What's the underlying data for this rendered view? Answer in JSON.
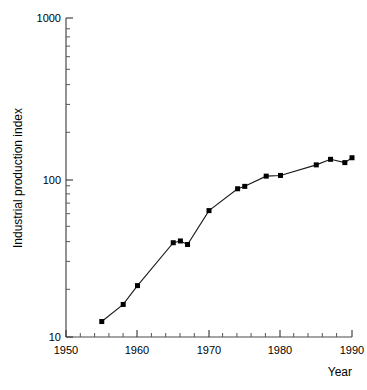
{
  "chart_data": {
    "type": "line",
    "title": "",
    "xlabel": "Year",
    "ylabel": "Industrial production index",
    "xlim": [
      1950,
      1990
    ],
    "ylim": [
      10,
      1000
    ],
    "yscale": "log",
    "xscale": "linear",
    "grid": false,
    "legend": null,
    "marker": "square",
    "series_color": "#000000",
    "xticks": [
      1950,
      1960,
      1970,
      1980,
      1990
    ],
    "xticklabels": [
      "1950",
      "1960",
      "1970",
      "1980",
      "1990"
    ],
    "xminorticks": [
      1952,
      1954,
      1956,
      1958,
      1962,
      1964,
      1966,
      1968,
      1972,
      1974,
      1976,
      1978,
      1982,
      1984,
      1986,
      1988
    ],
    "yticks": [
      10,
      100,
      1000
    ],
    "yticklabels": [
      "10",
      "100",
      "1000"
    ],
    "yminorticks": [
      20,
      30,
      40,
      50,
      60,
      70,
      80,
      90,
      200,
      300,
      400,
      500,
      600,
      700,
      800,
      900
    ],
    "x": [
      1955,
      1958,
      1960,
      1965,
      1966,
      1967,
      1970,
      1974,
      1975,
      1978,
      1980,
      1985,
      1987,
      1989,
      1990
    ],
    "values": [
      12.5,
      16,
      21,
      39,
      40,
      38,
      62,
      85,
      88,
      102,
      103,
      120,
      130,
      124,
      133
    ],
    "points": [
      {
        "year": 1955,
        "value": 12.5
      },
      {
        "year": 1958,
        "value": 16
      },
      {
        "year": 1960,
        "value": 21
      },
      {
        "year": 1965,
        "value": 39
      },
      {
        "year": 1966,
        "value": 40
      },
      {
        "year": 1967,
        "value": 38
      },
      {
        "year": 1970,
        "value": 62
      },
      {
        "year": 1974,
        "value": 85
      },
      {
        "year": 1975,
        "value": 88
      },
      {
        "year": 1978,
        "value": 102
      },
      {
        "year": 1980,
        "value": 103
      },
      {
        "year": 1985,
        "value": 120
      },
      {
        "year": 1987,
        "value": 130
      },
      {
        "year": 1989,
        "value": 124
      },
      {
        "year": 1990,
        "value": 133
      }
    ]
  },
  "axis": {
    "y_title": "Industrial production index",
    "x_title": "Year",
    "y_labels": {
      "top": "1000",
      "mid": "100",
      "bottom": "10"
    },
    "x_labels": {
      "t1950": "1950",
      "t1960": "1960",
      "t1970": "1970",
      "t1980": "1980",
      "t1990": "1990"
    }
  }
}
